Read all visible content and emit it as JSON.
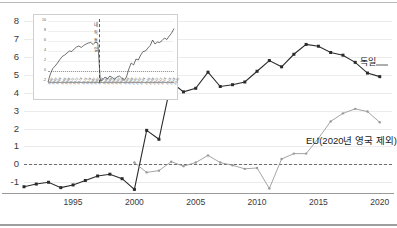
{
  "chart_data": {
    "type": "line",
    "title": "",
    "xlabel": "",
    "ylabel": "",
    "xlim": [
      1991,
      2021
    ],
    "ylim": [
      -1.6,
      8.4
    ],
    "yticks": [
      -1,
      0,
      1,
      2,
      3,
      4,
      5,
      6,
      7,
      8
    ],
    "xticks": [
      1995,
      2000,
      2005,
      2010,
      2015,
      2020
    ],
    "grid": true,
    "legend_position": "inline-annotation",
    "zero_reference_line": 0,
    "x": [
      1991,
      1992,
      1993,
      1994,
      1995,
      1996,
      1997,
      1998,
      1999,
      2000,
      2001,
      2002,
      2003,
      2004,
      2005,
      2006,
      2007,
      2008,
      2009,
      2010,
      2011,
      2012,
      2013,
      2014,
      2015,
      2016,
      2017,
      2018,
      2019,
      2020
    ],
    "series": [
      {
        "name": "독일",
        "color": "#2b2b2b",
        "marker": "square",
        "values": [
          -1.25,
          -1.1,
          -1.0,
          -1.3,
          -1.15,
          -0.9,
          -0.65,
          -0.55,
          -0.8,
          -1.4,
          1.9,
          1.4,
          4.6,
          4.05,
          4.25,
          5.15,
          4.35,
          4.45,
          4.6,
          5.2,
          5.8,
          5.45,
          6.15,
          6.7,
          6.6,
          6.25,
          6.1,
          5.7,
          5.1,
          4.9
        ]
      },
      {
        "name": "EU(2020년 영국 제외)",
        "color": "#9a9a9a",
        "marker": "dot",
        "values": [
          null,
          null,
          null,
          null,
          null,
          null,
          null,
          null,
          null,
          0.1,
          -0.45,
          -0.35,
          0.15,
          -0.1,
          0.1,
          0.5,
          0.1,
          -0.05,
          -0.25,
          -0.2,
          -1.35,
          0.3,
          0.6,
          0.6,
          1.45,
          2.4,
          2.85,
          3.1,
          2.95,
          2.35
        ]
      }
    ],
    "annotations": [
      {
        "name": "germany-label",
        "text": "독일",
        "series": "독일"
      },
      {
        "name": "eu-label",
        "text": "EU(2020년 영국 제외)",
        "series": "EU(2020년 영국 제외)"
      }
    ],
    "inset": {
      "type": "line",
      "yticks": [
        "10",
        "8",
        "6",
        "4",
        "2",
        "0",
        "-2"
      ],
      "ylim": [
        -2.4,
        10.4
      ],
      "zero_reference_line": 0,
      "vline_label": "내 독 통 일",
      "xticks": [
        "1960",
        "1962",
        "1964",
        "1966",
        "1968",
        "1970",
        "1972",
        "1974",
        "1976",
        "1978",
        "1980",
        "1982",
        "1984",
        "1986",
        "1988",
        "1990",
        "1992",
        "1994",
        "1996",
        "1998",
        "2000",
        "2002",
        "2004",
        "2006",
        "2008",
        "2010",
        "2012",
        "2014",
        "2016",
        "2018",
        "2020"
      ],
      "values": [
        -2.2,
        -0.6,
        0.5,
        1.0,
        1.6,
        2.3,
        2.9,
        3.2,
        3.6,
        4.0,
        3.9,
        4.4,
        4.8,
        5.0,
        4.7,
        5.1,
        5.4,
        5.6,
        5.7,
        5.3,
        5.8,
        5.5,
        -1.9,
        -1.8,
        -1.2,
        -1.6,
        -1.0,
        -1.3,
        -1.6,
        -1.2,
        -1.0,
        -1.4,
        -1.9,
        -1.2,
        0.4,
        1.6,
        1.2,
        2.4,
        2.2,
        3.2,
        3.9,
        4.0,
        4.6,
        5.1,
        6.2,
        5.4,
        5.8,
        5.7,
        6.1,
        6.6,
        6.3,
        7.0,
        7.6,
        8.5
      ]
    }
  }
}
